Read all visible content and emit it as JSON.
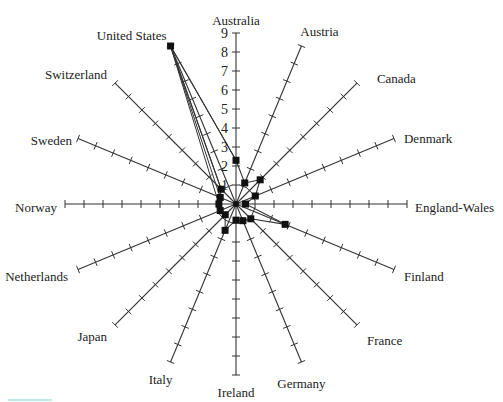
{
  "chart_data": {
    "type": "radar",
    "title": "",
    "categories": [
      "Australia",
      "Austria",
      "Canada",
      "Denmark",
      "England-Wales",
      "Finland",
      "France",
      "Germany",
      "Ireland",
      "Italy",
      "Japan",
      "Netherlands",
      "Norway",
      "Sweden",
      "Switzerland",
      "United States"
    ],
    "series": [
      {
        "name": "Value",
        "values": [
          2.3,
          1.2,
          1.8,
          1.1,
          0.5,
          2.8,
          1.1,
          0.95,
          0.85,
          1.5,
          0.8,
          0.9,
          0.9,
          0.9,
          1.1,
          9.0
        ]
      }
    ],
    "axis_range": [
      0,
      9
    ],
    "tick_labels": [
      "1",
      "2",
      "3",
      "4",
      "5",
      "6",
      "7",
      "8",
      "9"
    ],
    "tick_label_axis": "Australia",
    "grid": false,
    "legend": "none",
    "colors": {
      "line": "#333333",
      "marker": "#111111",
      "axis": "#333333"
    }
  }
}
